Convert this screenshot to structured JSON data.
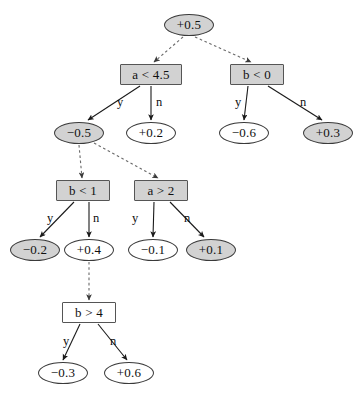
{
  "diagram": {
    "colors": {
      "shaded_fill": "#d2d2d2",
      "plain_fill": "#ffffff",
      "ellipse_stroke": "#3a3a3a",
      "box_stroke": "#555555",
      "solid_edge": "#1a1a1a",
      "dashed_edge": "#6a6a6a",
      "background": "#ffffff"
    },
    "nodes": [
      {
        "id": "n_root",
        "label": "+0.5",
        "shape": "ellipse",
        "fill": "shaded",
        "x": 164,
        "y": 14,
        "w": 50,
        "h": 22
      },
      {
        "id": "n_a45",
        "label": "a < 4.5",
        "shape": "box",
        "fill": "shaded",
        "x": 120,
        "y": 64,
        "w": 62,
        "h": 21
      },
      {
        "id": "n_b0",
        "label": "b < 0",
        "shape": "box",
        "fill": "shaded",
        "x": 230,
        "y": 64,
        "w": 54,
        "h": 21
      },
      {
        "id": "n_m05",
        "label": "−0.5",
        "shape": "ellipse",
        "fill": "shaded",
        "x": 54,
        "y": 122,
        "w": 50,
        "h": 22
      },
      {
        "id": "n_p02",
        "label": "+0.2",
        "shape": "ellipse",
        "fill": "plain",
        "x": 126,
        "y": 122,
        "w": 50,
        "h": 22
      },
      {
        "id": "n_m06",
        "label": "−0.6",
        "shape": "ellipse",
        "fill": "plain",
        "x": 219,
        "y": 122,
        "w": 50,
        "h": 22
      },
      {
        "id": "n_p03",
        "label": "+0.3",
        "shape": "ellipse",
        "fill": "shaded",
        "x": 303,
        "y": 122,
        "w": 50,
        "h": 22
      },
      {
        "id": "n_b1",
        "label": "b < 1",
        "shape": "box",
        "fill": "shaded",
        "x": 56,
        "y": 180,
        "w": 54,
        "h": 21
      },
      {
        "id": "n_a2",
        "label": "a > 2",
        "shape": "box",
        "fill": "shaded",
        "x": 134,
        "y": 180,
        "w": 54,
        "h": 21
      },
      {
        "id": "n_m02",
        "label": "−0.2",
        "shape": "ellipse",
        "fill": "shaded",
        "x": 10,
        "y": 239,
        "w": 50,
        "h": 22
      },
      {
        "id": "n_p04",
        "label": "+0.4",
        "shape": "ellipse",
        "fill": "plain",
        "x": 64,
        "y": 239,
        "w": 50,
        "h": 22
      },
      {
        "id": "n_m01",
        "label": "−0.1",
        "shape": "ellipse",
        "fill": "plain",
        "x": 128,
        "y": 239,
        "w": 50,
        "h": 22
      },
      {
        "id": "n_p01",
        "label": "+0.1",
        "shape": "ellipse",
        "fill": "shaded",
        "x": 186,
        "y": 239,
        "w": 50,
        "h": 22
      },
      {
        "id": "n_b4",
        "label": "b > 4",
        "shape": "box",
        "fill": "plain",
        "x": 62,
        "y": 302,
        "w": 54,
        "h": 21
      },
      {
        "id": "n_m03",
        "label": "−0.3",
        "shape": "ellipse",
        "fill": "plain",
        "x": 38,
        "y": 362,
        "w": 50,
        "h": 22
      },
      {
        "id": "n_p06",
        "label": "+0.6",
        "shape": "ellipse",
        "fill": "plain",
        "x": 104,
        "y": 362,
        "w": 50,
        "h": 22
      }
    ],
    "edges": [
      {
        "id": "e_root_a45",
        "from": "n_root",
        "to": "n_a45",
        "style": "dashed",
        "label": "",
        "x1": 183,
        "y1": 37,
        "x2": 154,
        "y2": 62
      },
      {
        "id": "e_root_b0",
        "from": "n_root",
        "to": "n_b0",
        "style": "dashed",
        "label": "",
        "x1": 195,
        "y1": 37,
        "x2": 251,
        "y2": 62
      },
      {
        "id": "e_a45_m05",
        "from": "n_a45",
        "to": "n_m05",
        "style": "solid",
        "label": "y",
        "x1": 140,
        "y1": 86,
        "x2": 88,
        "y2": 120
      },
      {
        "id": "e_a45_p02",
        "from": "n_a45",
        "to": "n_p02",
        "style": "solid",
        "label": "n",
        "x1": 151,
        "y1": 86,
        "x2": 151,
        "y2": 120
      },
      {
        "id": "e_b0_m06",
        "from": "n_b0",
        "to": "n_m06",
        "style": "solid",
        "label": "y",
        "x1": 248,
        "y1": 86,
        "x2": 244,
        "y2": 120
      },
      {
        "id": "e_b0_p03",
        "from": "n_b0",
        "to": "n_p03",
        "style": "solid",
        "label": "n",
        "x1": 268,
        "y1": 86,
        "x2": 322,
        "y2": 120
      },
      {
        "id": "e_m05_b1",
        "from": "n_m05",
        "to": "n_b1",
        "style": "dashed",
        "label": "",
        "x1": 79,
        "y1": 145,
        "x2": 82,
        "y2": 178
      },
      {
        "id": "e_m05_a2",
        "from": "n_m05",
        "to": "n_a2",
        "style": "dashed",
        "label": "",
        "x1": 94,
        "y1": 143,
        "x2": 158,
        "y2": 178
      },
      {
        "id": "e_b1_m02",
        "from": "n_b1",
        "to": "n_m02",
        "style": "solid",
        "label": "y",
        "x1": 74,
        "y1": 202,
        "x2": 40,
        "y2": 237
      },
      {
        "id": "e_b1_p04",
        "from": "n_b1",
        "to": "n_p04",
        "style": "solid",
        "label": "n",
        "x1": 89,
        "y1": 202,
        "x2": 89,
        "y2": 237
      },
      {
        "id": "e_a2_m01",
        "from": "n_a2",
        "to": "n_m01",
        "style": "solid",
        "label": "y",
        "x1": 154,
        "y1": 202,
        "x2": 153,
        "y2": 237
      },
      {
        "id": "e_a2_p01",
        "from": "n_a2",
        "to": "n_p01",
        "style": "solid",
        "label": "n",
        "x1": 170,
        "y1": 202,
        "x2": 204,
        "y2": 237
      },
      {
        "id": "e_p04_b4",
        "from": "n_p04",
        "to": "n_b4",
        "style": "dashed",
        "label": "",
        "x1": 89,
        "y1": 262,
        "x2": 89,
        "y2": 300
      },
      {
        "id": "e_b4_m03",
        "from": "n_b4",
        "to": "n_m03",
        "style": "solid",
        "label": "y",
        "x1": 80,
        "y1": 324,
        "x2": 63,
        "y2": 360
      },
      {
        "id": "e_b4_p06",
        "from": "n_b4",
        "to": "n_p06",
        "style": "solid",
        "label": "n",
        "x1": 98,
        "y1": 324,
        "x2": 127,
        "y2": 360
      }
    ],
    "edge_labels": [
      {
        "id": "lb_a45_y",
        "text": "y",
        "x": 117,
        "y": 95
      },
      {
        "id": "lb_a45_n",
        "text": "n",
        "x": 156,
        "y": 95
      },
      {
        "id": "lb_b0_y",
        "text": "y",
        "x": 235,
        "y": 95
      },
      {
        "id": "lb_b0_n",
        "text": "n",
        "x": 300,
        "y": 95
      },
      {
        "id": "lb_b1_y",
        "text": "y",
        "x": 47,
        "y": 211
      },
      {
        "id": "lb_b1_n",
        "text": "n",
        "x": 93,
        "y": 211
      },
      {
        "id": "lb_a2_y",
        "text": "y",
        "x": 132,
        "y": 211
      },
      {
        "id": "lb_a2_n",
        "text": "n",
        "x": 184,
        "y": 211
      },
      {
        "id": "lb_b4_y",
        "text": "y",
        "x": 63,
        "y": 334
      },
      {
        "id": "lb_b4_n",
        "text": "n",
        "x": 110,
        "y": 334
      }
    ]
  }
}
